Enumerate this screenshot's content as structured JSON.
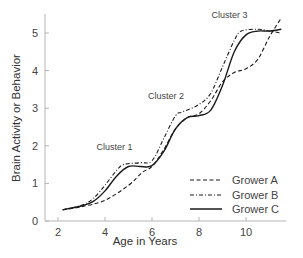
{
  "chart_data": {
    "type": "line",
    "title": "",
    "xlabel": "Age in Years",
    "ylabel": "Brain Activity or Behavior",
    "xlim": [
      1.5,
      11.7
    ],
    "ylim": [
      0,
      5.5
    ],
    "xticks": [
      2,
      4,
      6,
      8,
      10
    ],
    "yticks": [
      0,
      1,
      2,
      3,
      4,
      5
    ],
    "grid": false,
    "legend_position": "lower right",
    "annotations": [
      {
        "text": "Cluster 1",
        "x": 4.4,
        "y": 1.9
      },
      {
        "text": "Cluster 2",
        "x": 6.6,
        "y": 3.25
      },
      {
        "text": "Cluster 3",
        "x": 9.3,
        "y": 5.4
      }
    ],
    "series": [
      {
        "name": "Grower A",
        "style": "dashed",
        "x": [
          2.2,
          3.0,
          4.0,
          5.0,
          5.6,
          6.0,
          6.5,
          7.0,
          7.5,
          8.0,
          8.5,
          9.0,
          9.5,
          10.0,
          10.5,
          11.0,
          11.5
        ],
        "y": [
          0.3,
          0.38,
          0.55,
          0.95,
          1.3,
          1.45,
          1.9,
          2.45,
          2.75,
          2.85,
          3.2,
          3.7,
          3.95,
          4.05,
          4.3,
          4.9,
          5.4
        ]
      },
      {
        "name": "Grower B",
        "style": "dashdot",
        "x": [
          2.2,
          3.0,
          3.5,
          4.0,
          4.5,
          4.8,
          5.5,
          6.0,
          6.5,
          7.0,
          7.3,
          8.0,
          8.5,
          9.0,
          9.5,
          9.8,
          10.5,
          11.0,
          11.5
        ],
        "y": [
          0.3,
          0.42,
          0.6,
          0.95,
          1.35,
          1.5,
          1.55,
          1.6,
          2.2,
          2.8,
          2.9,
          3.1,
          3.4,
          4.1,
          4.8,
          5.05,
          5.1,
          5.05,
          5.0
        ]
      },
      {
        "name": "Grower C",
        "style": "solid",
        "x": [
          2.2,
          3.0,
          3.5,
          4.0,
          4.5,
          5.0,
          5.5,
          6.0,
          6.5,
          7.0,
          7.5,
          8.0,
          8.5,
          9.0,
          9.5,
          10.0,
          10.5,
          11.0,
          11.5
        ],
        "y": [
          0.3,
          0.4,
          0.52,
          0.8,
          1.2,
          1.45,
          1.45,
          1.47,
          1.85,
          2.45,
          2.75,
          2.8,
          2.95,
          3.6,
          4.5,
          4.95,
          5.05,
          5.05,
          5.1
        ]
      }
    ]
  },
  "legend": {
    "items": [
      {
        "label": "Grower A"
      },
      {
        "label": "Grower B"
      },
      {
        "label": "Grower C"
      }
    ]
  },
  "colors": {
    "axis": "#b5b5b5",
    "line": "#1a1a1a",
    "text": "#444444"
  }
}
